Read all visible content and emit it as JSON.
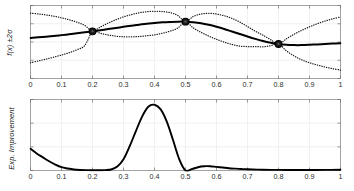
{
  "figure": {
    "background_color": "#ffffff",
    "frame_color": "#8c8c8c",
    "grid_color": "#e8e8e8",
    "curve_color": "#000000"
  },
  "chart_data": [
    {
      "type": "line",
      "panel": "top",
      "title": "",
      "xlabel": "",
      "ylabel": "f(x) ±2σ",
      "xlim": [
        0,
        1
      ],
      "ylim": [
        -2.6,
        2.6
      ],
      "grid": true,
      "legend_position": "none",
      "xticks": [
        0,
        0.1,
        0.2,
        0.3,
        0.4,
        0.5,
        0.6,
        0.7,
        0.8,
        0.9,
        1
      ],
      "xticklabels": [
        "0",
        "0.1",
        "0.2",
        "0.3",
        "0.4",
        "0.5",
        "0.6",
        "0.7",
        "0.8",
        "0.9",
        "1"
      ],
      "yticks": [],
      "yticklabels": [],
      "series": [
        {
          "name": "posterior mean",
          "style": "solid",
          "x": [
            0,
            0.025,
            0.05,
            0.075,
            0.1,
            0.125,
            0.15,
            0.175,
            0.2,
            0.225,
            0.25,
            0.275,
            0.3,
            0.325,
            0.35,
            0.375,
            0.4,
            0.425,
            0.45,
            0.475,
            0.5,
            0.525,
            0.55,
            0.575,
            0.6,
            0.625,
            0.65,
            0.675,
            0.7,
            0.725,
            0.75,
            0.775,
            0.8,
            0.825,
            0.85,
            0.875,
            0.9,
            0.925,
            0.95,
            0.975,
            1
          ],
          "values": [
            0.29,
            0.33,
            0.38,
            0.43,
            0.49,
            0.55,
            0.62,
            0.69,
            0.76,
            0.84,
            0.92,
            1.0,
            1.08,
            1.16,
            1.23,
            1.3,
            1.35,
            1.4,
            1.43,
            1.45,
            1.45,
            1.41,
            1.34,
            1.23,
            1.09,
            0.93,
            0.75,
            0.57,
            0.39,
            0.22,
            0.07,
            -0.05,
            -0.14,
            -0.2,
            -0.22,
            -0.22,
            -0.2,
            -0.17,
            -0.14,
            -0.11,
            -0.09
          ]
        },
        {
          "name": "upper bound (+2σ)",
          "style": "dotted",
          "x": [
            0,
            0.025,
            0.05,
            0.075,
            0.1,
            0.125,
            0.15,
            0.175,
            0.2,
            0.225,
            0.25,
            0.275,
            0.3,
            0.325,
            0.35,
            0.375,
            0.4,
            0.425,
            0.45,
            0.475,
            0.5,
            0.525,
            0.55,
            0.575,
            0.6,
            0.625,
            0.65,
            0.675,
            0.7,
            0.725,
            0.75,
            0.775,
            0.8,
            0.825,
            0.85,
            0.875,
            0.9,
            0.925,
            0.95,
            0.975,
            1
          ],
          "values": [
            2.05,
            2.0,
            1.93,
            1.84,
            1.72,
            1.58,
            1.41,
            1.18,
            0.79,
            1.06,
            1.34,
            1.58,
            1.79,
            1.95,
            2.08,
            2.16,
            2.19,
            2.17,
            2.09,
            1.89,
            1.45,
            1.82,
            1.99,
            2.04,
            1.99,
            1.87,
            1.68,
            1.42,
            1.1,
            0.77,
            0.48,
            0.16,
            -0.15,
            0.22,
            0.55,
            0.83,
            1.08,
            1.3,
            1.49,
            1.65,
            1.78
          ]
        },
        {
          "name": "lower bound (-2σ)",
          "style": "dotted",
          "x": [
            0,
            0.025,
            0.05,
            0.075,
            0.1,
            0.125,
            0.15,
            0.175,
            0.2,
            0.225,
            0.25,
            0.275,
            0.3,
            0.325,
            0.35,
            0.375,
            0.4,
            0.425,
            0.45,
            0.475,
            0.5,
            0.525,
            0.55,
            0.575,
            0.6,
            0.625,
            0.65,
            0.675,
            0.7,
            0.725,
            0.75,
            0.775,
            0.8,
            0.825,
            0.85,
            0.875,
            0.9,
            0.925,
            0.95,
            0.975,
            1
          ],
          "values": [
            -1.48,
            -1.35,
            -1.22,
            -1.08,
            -0.93,
            -0.76,
            -0.55,
            -0.25,
            0.73,
            0.62,
            0.5,
            0.42,
            0.37,
            0.37,
            0.39,
            0.44,
            0.51,
            0.62,
            0.77,
            0.99,
            1.45,
            1.0,
            0.69,
            0.42,
            0.19,
            -0.01,
            -0.18,
            -0.29,
            -0.33,
            -0.33,
            -0.34,
            -0.26,
            -0.13,
            -0.62,
            -0.99,
            -1.27,
            -1.48,
            -1.64,
            -1.78,
            -1.9,
            -2.0
          ]
        }
      ],
      "observations": [
        {
          "x": 0.2,
          "y": 0.76,
          "marker": "circle"
        },
        {
          "x": 0.5,
          "y": 1.45,
          "marker": "circle"
        },
        {
          "x": 0.8,
          "y": -0.14,
          "marker": "circle"
        }
      ]
    },
    {
      "type": "line",
      "panel": "bottom",
      "title": "",
      "xlabel": "",
      "ylabel": "Exp. Improvement",
      "xlim": [
        0,
        1
      ],
      "ylim": [
        0,
        1.08
      ],
      "grid": true,
      "legend_position": "none",
      "xticks": [
        0,
        0.1,
        0.2,
        0.3,
        0.4,
        0.5,
        0.6,
        0.7,
        0.8,
        0.9,
        1
      ],
      "xticklabels": [
        "0",
        "0.1",
        "0.2",
        "0.3",
        "0.4",
        "0.5",
        "0.6",
        "0.7",
        "0.8",
        "0.9",
        "1"
      ],
      "yticks": [],
      "yticklabels": [],
      "series": [
        {
          "name": "Expected Improvement",
          "style": "solid",
          "x": [
            0,
            0.02,
            0.04,
            0.06,
            0.08,
            0.1,
            0.12,
            0.14,
            0.16,
            0.18,
            0.2,
            0.22,
            0.24,
            0.26,
            0.28,
            0.3,
            0.32,
            0.34,
            0.36,
            0.38,
            0.4,
            0.42,
            0.44,
            0.46,
            0.48,
            0.5,
            0.52,
            0.54,
            0.56,
            0.58,
            0.6,
            0.62,
            0.64,
            0.66,
            0.68,
            0.7,
            0.75,
            0.8,
            0.85,
            0.9,
            0.95,
            1
          ],
          "values": [
            0.33,
            0.26,
            0.2,
            0.14,
            0.09,
            0.05,
            0.03,
            0.015,
            0.008,
            0.005,
            0.004,
            0.004,
            0.006,
            0.015,
            0.06,
            0.17,
            0.37,
            0.6,
            0.82,
            0.97,
            1.0,
            0.93,
            0.74,
            0.46,
            0.17,
            0.0,
            0.02,
            0.05,
            0.065,
            0.065,
            0.055,
            0.045,
            0.035,
            0.028,
            0.022,
            0.018,
            0.012,
            0.009,
            0.008,
            0.008,
            0.009,
            0.012
          ]
        }
      ]
    }
  ]
}
